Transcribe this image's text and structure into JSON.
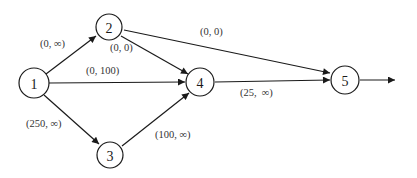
{
  "diagram": {
    "type": "flow-network",
    "nodes": [
      {
        "id": "1",
        "label": "1",
        "x": 34,
        "y": 83
      },
      {
        "id": "2",
        "label": "2",
        "x": 109,
        "y": 27
      },
      {
        "id": "3",
        "label": "3",
        "x": 110,
        "y": 155
      },
      {
        "id": "4",
        "label": "4",
        "x": 200,
        "y": 82
      },
      {
        "id": "5",
        "label": "5",
        "x": 345,
        "y": 80
      }
    ],
    "edges": [
      {
        "from": "1",
        "to": "2",
        "label": "(0, ∞)",
        "lx": 40,
        "ly": 47
      },
      {
        "from": "1",
        "to": "4",
        "label": "(0, 100)",
        "lx": 86,
        "ly": 74
      },
      {
        "from": "1",
        "to": "3",
        "label": "(250, ∞)",
        "lx": 26,
        "ly": 127
      },
      {
        "from": "2",
        "to": "4",
        "label": "(0, 0)",
        "lx": 110,
        "ly": 51
      },
      {
        "from": "2",
        "to": "5",
        "label": "(0, 0)",
        "lx": 200,
        "ly": 35
      },
      {
        "from": "3",
        "to": "4",
        "label": "(100, ∞)",
        "lx": 155,
        "ly": 138
      },
      {
        "from": "4",
        "to": "5",
        "label": "(25,  ∞)",
        "lx": 240,
        "ly": 96
      }
    ],
    "outflow": {
      "from": "5",
      "x2": 395,
      "y2": 80
    }
  },
  "colors": {
    "stroke": "#1a1a1a",
    "text": "#333333",
    "background": "#ffffff"
  }
}
